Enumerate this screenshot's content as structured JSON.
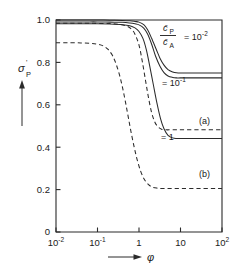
{
  "chart_data": {
    "type": "line",
    "title": "",
    "xlabel": "φ",
    "ylabel": "σ'_P",
    "xscale": "log",
    "xlim": [
      0.01,
      100
    ],
    "ylim": [
      0,
      1.0
    ],
    "grid": false,
    "legend_position": "inside-upper-right",
    "x_tick_labels": [
      "10⁻²",
      "10⁻¹",
      "1",
      "10",
      "10²"
    ],
    "x_tick_values": [
      0.01,
      0.1,
      1,
      10,
      100
    ],
    "y_tick_labels": [
      "0",
      "0.2",
      "0.4",
      "0.6",
      "0.8",
      "1.0"
    ],
    "y_tick_values": [
      0,
      0.2,
      0.4,
      0.6,
      0.8,
      1.0
    ],
    "legend_numerator": "c̄",
    "legend_numerator_sub": "P",
    "legend_denominator": "c̄",
    "legend_denominator_sub": "A",
    "legend_equals": "= 10",
    "legend_equals_sup": "-2",
    "series": [
      {
        "name": "cP/cA = 10^-2",
        "style": "solid",
        "label": "",
        "start_value": 1.0,
        "plateau_value": 0.75,
        "midpoint_x": 2.6,
        "points": [
          [
            0.01,
            1.0
          ],
          [
            0.02,
            1.0
          ],
          [
            0.05,
            1.0
          ],
          [
            0.1,
            1.0
          ],
          [
            0.2,
            0.999
          ],
          [
            0.4,
            0.998
          ],
          [
            0.6,
            0.996
          ],
          [
            0.8,
            0.993
          ],
          [
            1.0,
            0.99
          ],
          [
            1.3,
            0.978
          ],
          [
            1.6,
            0.955
          ],
          [
            2.0,
            0.915
          ],
          [
            2.6,
            0.862
          ],
          [
            3.2,
            0.82
          ],
          [
            4.0,
            0.787
          ],
          [
            5.0,
            0.766
          ],
          [
            6.5,
            0.755
          ],
          [
            8.0,
            0.751
          ],
          [
            10,
            0.75
          ],
          [
            20,
            0.75
          ],
          [
            50,
            0.75
          ],
          [
            100,
            0.75
          ]
        ]
      },
      {
        "name": "cP/cA = 10^-1",
        "style": "solid",
        "label": "= 10",
        "label_sup": "-1",
        "start_value": 0.991,
        "plateau_value": 0.727,
        "midpoint_x": 2.2,
        "points": [
          [
            0.01,
            0.991
          ],
          [
            0.02,
            0.991
          ],
          [
            0.05,
            0.991
          ],
          [
            0.1,
            0.991
          ],
          [
            0.2,
            0.99
          ],
          [
            0.4,
            0.989
          ],
          [
            0.6,
            0.986
          ],
          [
            0.8,
            0.982
          ],
          [
            1.0,
            0.977
          ],
          [
            1.3,
            0.962
          ],
          [
            1.6,
            0.935
          ],
          [
            2.0,
            0.888
          ],
          [
            2.5,
            0.83
          ],
          [
            3.2,
            0.782
          ],
          [
            4.0,
            0.752
          ],
          [
            5.0,
            0.736
          ],
          [
            6.5,
            0.729
          ],
          [
            8.0,
            0.727
          ],
          [
            10,
            0.727
          ],
          [
            20,
            0.727
          ],
          [
            50,
            0.727
          ],
          [
            100,
            0.727
          ]
        ]
      },
      {
        "name": "curve (a)",
        "style": "dashed",
        "label": "(a)",
        "start_value": 0.985,
        "plateau_value": 0.482,
        "midpoint_x": 1.35,
        "points": [
          [
            0.01,
            0.985
          ],
          [
            0.02,
            0.985
          ],
          [
            0.05,
            0.985
          ],
          [
            0.1,
            0.984
          ],
          [
            0.2,
            0.983
          ],
          [
            0.35,
            0.979
          ],
          [
            0.5,
            0.972
          ],
          [
            0.65,
            0.958
          ],
          [
            0.8,
            0.933
          ],
          [
            1.0,
            0.882
          ],
          [
            1.2,
            0.805
          ],
          [
            1.45,
            0.71
          ],
          [
            1.7,
            0.632
          ],
          [
            2.0,
            0.566
          ],
          [
            2.4,
            0.519
          ],
          [
            2.9,
            0.495
          ],
          [
            3.5,
            0.485
          ],
          [
            4.5,
            0.482
          ],
          [
            6,
            0.482
          ],
          [
            10,
            0.482
          ],
          [
            30,
            0.482
          ],
          [
            100,
            0.482
          ]
        ]
      },
      {
        "name": "cP/cA = 1",
        "style": "solid",
        "label": "= 1",
        "start_value": 0.982,
        "plateau_value": 0.441,
        "midpoint_x": 1.8,
        "points": [
          [
            0.01,
            0.982
          ],
          [
            0.02,
            0.982
          ],
          [
            0.05,
            0.982
          ],
          [
            0.1,
            0.982
          ],
          [
            0.2,
            0.981
          ],
          [
            0.4,
            0.978
          ],
          [
            0.6,
            0.973
          ],
          [
            0.8,
            0.963
          ],
          [
            1.0,
            0.946
          ],
          [
            1.25,
            0.912
          ],
          [
            1.5,
            0.86
          ],
          [
            1.8,
            0.786
          ],
          [
            2.2,
            0.698
          ],
          [
            2.7,
            0.609
          ],
          [
            3.3,
            0.535
          ],
          [
            4.0,
            0.487
          ],
          [
            5.0,
            0.456
          ],
          [
            6.5,
            0.444
          ],
          [
            8.0,
            0.441
          ],
          [
            10,
            0.441
          ],
          [
            30,
            0.441
          ],
          [
            100,
            0.441
          ]
        ]
      },
      {
        "name": "curve (b)",
        "style": "dashed",
        "label": "(b)",
        "start_value": 0.893,
        "plateau_value": 0.205,
        "midpoint_x": 0.52,
        "points": [
          [
            0.01,
            0.893
          ],
          [
            0.02,
            0.893
          ],
          [
            0.04,
            0.892
          ],
          [
            0.07,
            0.89
          ],
          [
            0.1,
            0.886
          ],
          [
            0.14,
            0.877
          ],
          [
            0.18,
            0.861
          ],
          [
            0.23,
            0.832
          ],
          [
            0.28,
            0.793
          ],
          [
            0.34,
            0.74
          ],
          [
            0.4,
            0.682
          ],
          [
            0.47,
            0.615
          ],
          [
            0.55,
            0.543
          ],
          [
            0.65,
            0.467
          ],
          [
            0.78,
            0.393
          ],
          [
            0.92,
            0.335
          ],
          [
            1.1,
            0.286
          ],
          [
            1.35,
            0.248
          ],
          [
            1.7,
            0.223
          ],
          [
            2.1,
            0.212
          ],
          [
            2.7,
            0.207
          ],
          [
            3.5,
            0.205
          ],
          [
            5,
            0.205
          ],
          [
            10,
            0.205
          ],
          [
            30,
            0.205
          ],
          [
            100,
            0.205
          ]
        ]
      }
    ]
  },
  "figure": {
    "y_axis_label_main": "σ",
    "y_axis_label_prime": "'",
    "y_axis_label_sub": "P",
    "x_axis_label": "φ"
  }
}
